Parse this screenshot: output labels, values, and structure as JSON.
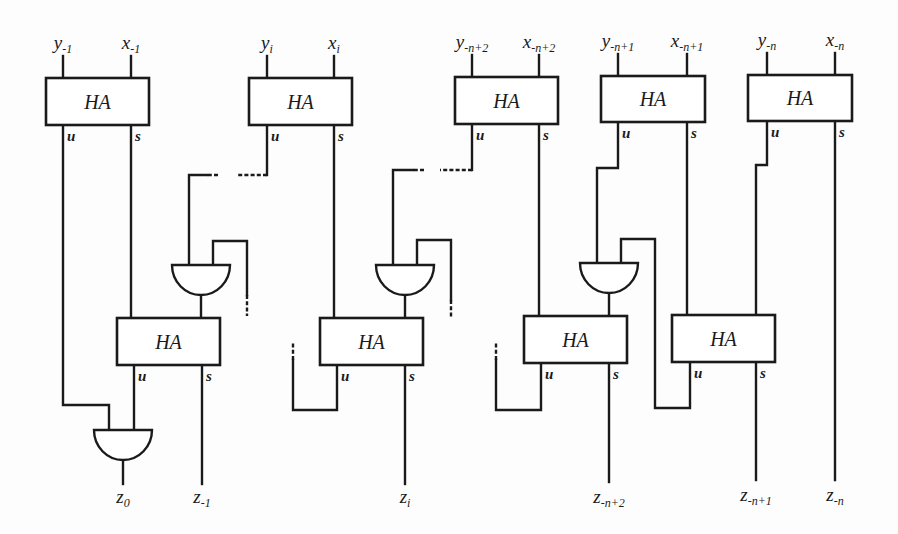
{
  "diagram": {
    "ha_label": "HA",
    "port_u": "u",
    "port_s": "s",
    "top_row": [
      {
        "id": "ha-top-1",
        "x": 46,
        "y": 78,
        "w": 103,
        "h": 47,
        "in_y": {
          "base": "y",
          "sub": "-1"
        },
        "in_x": {
          "base": "x",
          "sub": "-1"
        },
        "u_x": 63,
        "s_x": 131
      },
      {
        "id": "ha-top-2",
        "x": 249,
        "y": 78,
        "w": 103,
        "h": 47,
        "in_y": {
          "base": "y",
          "sub": "i"
        },
        "in_x": {
          "base": "x",
          "sub": "i"
        },
        "u_x": 267,
        "s_x": 334
      },
      {
        "id": "ha-top-3",
        "x": 455,
        "y": 77,
        "w": 103,
        "h": 47,
        "in_y": {
          "base": "y",
          "sub": "-n+2"
        },
        "in_x": {
          "base": "x",
          "sub": "-n+2"
        },
        "u_x": 472,
        "s_x": 539
      },
      {
        "id": "ha-top-4",
        "x": 601,
        "y": 76,
        "w": 104,
        "h": 46,
        "in_y": {
          "base": "y",
          "sub": "-n+1"
        },
        "in_x": {
          "base": "x",
          "sub": "-n+1"
        },
        "u_x": 618,
        "s_x": 687
      },
      {
        "id": "ha-top-5",
        "x": 748,
        "y": 75,
        "w": 104,
        "h": 46,
        "in_y": {
          "base": "y",
          "sub": "-n"
        },
        "in_x": {
          "base": "x",
          "sub": "-n"
        },
        "u_x": 767,
        "s_x": 835
      }
    ],
    "bottom_row": [
      {
        "id": "ha-bot-1",
        "x": 117,
        "y": 318,
        "w": 103,
        "h": 47,
        "u_x": 134,
        "s_x": 202
      },
      {
        "id": "ha-bot-2",
        "x": 320,
        "y": 318,
        "w": 103,
        "h": 47,
        "u_x": 337,
        "s_x": 405
      },
      {
        "id": "ha-bot-3",
        "x": 524,
        "y": 316,
        "w": 103,
        "h": 47,
        "u_x": 541,
        "s_x": 609
      },
      {
        "id": "ha-bot-4",
        "x": 672,
        "y": 315,
        "w": 103,
        "h": 47,
        "u_x": 690,
        "s_x": 756
      }
    ],
    "gates": [
      {
        "id": "and-gate-1",
        "cx": 201,
        "top": 265,
        "hw": 29,
        "h": 30
      },
      {
        "id": "and-gate-2",
        "cx": 405,
        "top": 265,
        "hw": 29,
        "h": 30
      },
      {
        "id": "and-gate-3",
        "cx": 609,
        "top": 263,
        "hw": 29,
        "h": 30
      },
      {
        "id": "and-gate-final",
        "cx": 123,
        "top": 430,
        "hw": 29,
        "h": 30
      }
    ],
    "outputs": [
      {
        "id": "z0",
        "base": "z",
        "sub": "0",
        "x": 123
      },
      {
        "id": "z-1",
        "base": "z",
        "sub": "-1",
        "x": 202
      },
      {
        "id": "zi",
        "base": "z",
        "sub": "i",
        "x": 405
      },
      {
        "id": "z-n+2",
        "base": "z",
        "sub": "-n+2",
        "x": 609
      },
      {
        "id": "z-n+1",
        "base": "z",
        "sub": "-n+1",
        "x": 756
      },
      {
        "id": "z-n",
        "base": "z",
        "sub": "-n",
        "x": 835
      }
    ],
    "colors": {
      "ink": "#1a1a1a",
      "paper": "#fdfdfd"
    }
  }
}
